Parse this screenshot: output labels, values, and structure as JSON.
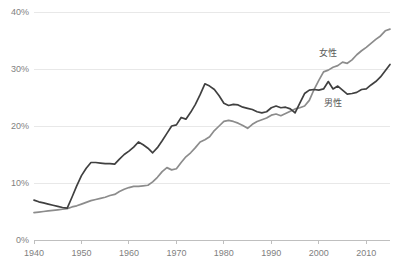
{
  "chart_data": {
    "type": "line",
    "title": "",
    "xlabel": "",
    "ylabel": "",
    "xlim": [
      1940,
      2015
    ],
    "ylim": [
      0,
      40
    ],
    "grid": true,
    "legend_position": "inline-annotation",
    "y_tick_labels": [
      "0%",
      "10%",
      "20%",
      "30%",
      "40%"
    ],
    "y_tick_values": [
      0,
      10,
      20,
      30,
      40
    ],
    "x_tick_labels": [
      "1940",
      "1950",
      "1960",
      "1970",
      "1980",
      "1990",
      "2000",
      "2010"
    ],
    "x_tick_values": [
      1940,
      1950,
      1960,
      1970,
      1980,
      1990,
      2000,
      2010
    ],
    "x": [
      1940,
      1941,
      1942,
      1943,
      1944,
      1945,
      1946,
      1947,
      1948,
      1949,
      1950,
      1951,
      1952,
      1953,
      1954,
      1955,
      1956,
      1957,
      1958,
      1959,
      1960,
      1961,
      1962,
      1963,
      1964,
      1965,
      1966,
      1967,
      1968,
      1969,
      1970,
      1971,
      1972,
      1973,
      1974,
      1975,
      1976,
      1977,
      1978,
      1979,
      1980,
      1981,
      1982,
      1983,
      1984,
      1985,
      1986,
      1987,
      1988,
      1989,
      1990,
      1991,
      1992,
      1993,
      1994,
      1995,
      1996,
      1997,
      1998,
      1999,
      2000,
      2001,
      2002,
      2003,
      2004,
      2005,
      2006,
      2007,
      2008,
      2009,
      2010,
      2011,
      2012,
      2013,
      2014,
      2015
    ],
    "series": [
      {
        "name": "女性",
        "color": "#8c8c8c",
        "label_x": 2002,
        "label_y": 32.2,
        "values": [
          4.8,
          4.9,
          5.0,
          5.1,
          5.2,
          5.3,
          5.4,
          5.5,
          5.8,
          6.0,
          6.3,
          6.6,
          6.9,
          7.1,
          7.3,
          7.5,
          7.8,
          8.0,
          8.5,
          8.9,
          9.2,
          9.4,
          9.4,
          9.5,
          9.6,
          10.2,
          11.0,
          12.0,
          12.7,
          12.3,
          12.5,
          13.6,
          14.6,
          15.3,
          16.2,
          17.2,
          17.6,
          18.1,
          19.2,
          20.0,
          20.8,
          21.0,
          20.8,
          20.5,
          20.1,
          19.6,
          20.3,
          20.8,
          21.1,
          21.4,
          21.9,
          22.1,
          21.8,
          22.2,
          22.6,
          23.0,
          23.2,
          23.5,
          24.5,
          26.4,
          28.0,
          29.5,
          29.8,
          30.3,
          30.6,
          31.2,
          31.0,
          31.6,
          32.5,
          33.2,
          33.8,
          34.5,
          35.2,
          35.8,
          36.7,
          37.0
        ]
      },
      {
        "name": "男性",
        "color": "#404040",
        "label_x": 2003,
        "label_y": 23.5,
        "values": [
          7.0,
          6.7,
          6.5,
          6.3,
          6.1,
          5.9,
          5.7,
          5.6,
          7.5,
          9.5,
          11.3,
          12.6,
          13.6,
          13.6,
          13.5,
          13.4,
          13.4,
          13.3,
          14.2,
          15.0,
          15.6,
          16.3,
          17.2,
          16.7,
          16.1,
          15.3,
          16.2,
          17.4,
          18.7,
          20.0,
          20.2,
          21.5,
          21.2,
          22.4,
          23.8,
          25.5,
          27.4,
          27.0,
          26.4,
          25.3,
          24.0,
          23.6,
          23.8,
          23.7,
          23.3,
          23.1,
          22.9,
          22.5,
          22.3,
          22.5,
          23.2,
          23.5,
          23.2,
          23.3,
          23.0,
          22.3,
          24.0,
          25.7,
          26.3,
          26.4,
          26.3,
          26.5,
          27.8,
          26.5,
          27.0,
          26.3,
          25.6,
          25.7,
          25.9,
          26.4,
          26.5,
          27.2,
          27.8,
          28.6,
          29.7,
          30.8
        ]
      }
    ]
  }
}
